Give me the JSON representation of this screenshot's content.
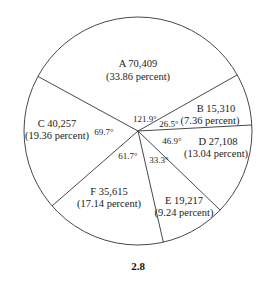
{
  "chart_data": {
    "type": "pie",
    "title": "",
    "caption": "2.8",
    "slices": [
      {
        "label": "A",
        "value": "70,409",
        "percent": "(33.86 percent)",
        "angle": 121.9,
        "angle_label": "121.9°"
      },
      {
        "label": "B",
        "value": "15,310",
        "percent": "(7.36 percent)",
        "angle": 26.5,
        "angle_label": "26.5°"
      },
      {
        "label": "D",
        "value": "27,108",
        "percent": "(13.04 percent)",
        "angle": 46.9,
        "angle_label": "46.9°"
      },
      {
        "label": "E",
        "value": "19,217",
        "percent": "(9.24 percent)",
        "angle": 33.3,
        "angle_label": "33.3°"
      },
      {
        "label": "F",
        "value": "35,615",
        "percent": "(17.14 percent)",
        "angle": 61.7,
        "angle_label": "61.7°"
      },
      {
        "label": "C",
        "value": "40,257",
        "percent": "(19.36 percent)",
        "angle": 69.7,
        "angle_label": "69.7°"
      }
    ]
  }
}
